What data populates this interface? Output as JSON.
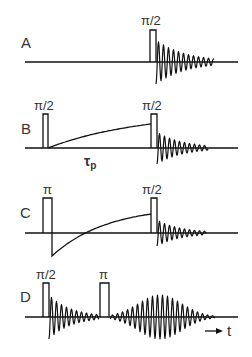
{
  "diagram": {
    "type": "nmr-pulse-sequences",
    "color": "#111111",
    "rows": [
      {
        "id": "A",
        "label": "A",
        "baseline_y": 62,
        "x_start": 25,
        "x_end": 238,
        "pulses": [
          {
            "label": "π/2",
            "x": 150,
            "w": 6,
            "top": 30
          }
        ],
        "fid": {
          "x0": 156,
          "x1": 214,
          "amp": 22,
          "period": 5,
          "decay": 30
        }
      },
      {
        "id": "B",
        "label": "B",
        "baseline_y": 148,
        "x_start": 25,
        "x_end": 238,
        "pulses": [
          {
            "label": "π/2",
            "x": 43,
            "w": 5,
            "top": 114
          },
          {
            "label": "π/2",
            "x": 151,
            "w": 6,
            "top": 114
          }
        ],
        "recovery": {
          "x0": 48,
          "y0": 148,
          "x1": 151,
          "y1": 124,
          "kind": "saturation"
        },
        "delay_label": {
          "main": "τ",
          "sub": "p"
        },
        "fid": {
          "x0": 157,
          "x1": 208,
          "amp": 16,
          "period": 5,
          "decay": 26
        }
      },
      {
        "id": "C",
        "label": "C",
        "baseline_y": 233,
        "x_start": 25,
        "x_end": 238,
        "pulses": [
          {
            "label": "π",
            "x": 43,
            "w": 9,
            "top": 198
          },
          {
            "label": "π/2",
            "x": 151,
            "w": 6,
            "top": 198
          }
        ],
        "recovery": {
          "x0": 52,
          "y0": 256,
          "x1": 151,
          "y1": 214,
          "kind": "inversion"
        },
        "fid": {
          "x0": 157,
          "x1": 206,
          "amp": 13,
          "period": 5,
          "decay": 24
        }
      },
      {
        "id": "D",
        "label": "D",
        "baseline_y": 317,
        "x_start": 25,
        "x_end": 238,
        "pulses": [
          {
            "label": "π/2",
            "x": 43,
            "w": 6,
            "top": 283
          },
          {
            "label": "π",
            "x": 100,
            "w": 9,
            "top": 283
          }
        ],
        "fid": {
          "x0": 49,
          "x1": 99,
          "amp": 22,
          "period": 5,
          "decay": 22
        },
        "echo": {
          "x0": 110,
          "x1": 215,
          "center": 160,
          "amp": 22,
          "period": 5,
          "width": 22
        }
      }
    ],
    "time_axis": {
      "label": "t",
      "arrow": "→"
    }
  }
}
